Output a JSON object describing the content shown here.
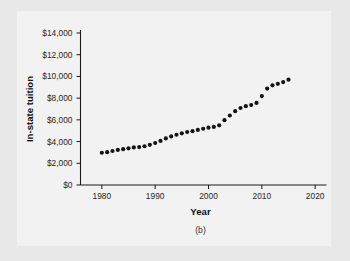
{
  "figure": {
    "caption": "(b)",
    "panel_bg": "#f2f2f2",
    "outer_bg": "#e8e8e8",
    "marker_color": "#141414"
  },
  "chart_data": {
    "type": "scatter",
    "title": "",
    "xlabel": "Year",
    "ylabel": "In-state tuition",
    "xlim": [
      1976,
      2021
    ],
    "ylim": [
      0,
      14000
    ],
    "grid": false,
    "legend": null,
    "xticks": [
      1980,
      1990,
      2000,
      2010,
      2020
    ],
    "xtick_labels": [
      "1980",
      "1990",
      "2000",
      "2010",
      "2020"
    ],
    "yticks": [
      0,
      2000,
      4000,
      6000,
      8000,
      10000,
      12000,
      14000
    ],
    "ytick_labels": [
      "$0",
      "$2,000",
      "$4,000",
      "$6,000",
      "$8,000",
      "$10,000",
      "$12,000",
      "$14,000"
    ],
    "x": [
      1980,
      1981,
      1982,
      1983,
      1984,
      1985,
      1986,
      1987,
      1988,
      1989,
      1990,
      1991,
      1992,
      1993,
      1994,
      1995,
      1996,
      1997,
      1998,
      1999,
      2000,
      2001,
      2002,
      2003,
      2004,
      2005,
      2006,
      2007,
      2008,
      2009,
      2010,
      2011,
      2012,
      2013,
      2014,
      2015
    ],
    "values": [
      2970,
      3020,
      3130,
      3230,
      3300,
      3380,
      3460,
      3490,
      3570,
      3700,
      3870,
      4060,
      4290,
      4470,
      4630,
      4760,
      4880,
      4960,
      5070,
      5180,
      5280,
      5350,
      5500,
      5970,
      6400,
      6800,
      7090,
      7260,
      7370,
      7560,
      8190,
      8880,
      9180,
      9320,
      9480,
      9700
    ]
  }
}
